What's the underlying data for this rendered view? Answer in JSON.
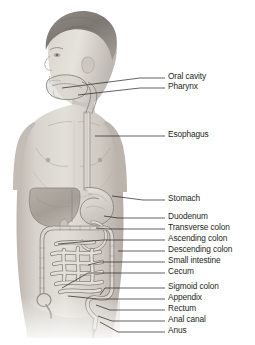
{
  "figure": {
    "view": "anterior male torso, head in left profile",
    "background_color": "#ffffff",
    "line_color": "#231f20",
    "skin_tone": "#cfcac4",
    "organ_tone": "#bdb8b2"
  },
  "labels": [
    {
      "id": "oral-cavity",
      "text": "Oral cavity",
      "text_x": 168,
      "text_y": 78,
      "leader_x1": 140,
      "leader_y1": 78,
      "leader_x2": 165,
      "leader_y2": 78,
      "anchor_x": 62,
      "anchor_y": 88
    },
    {
      "id": "pharynx",
      "text": "Pharynx",
      "text_x": 168,
      "text_y": 88,
      "leader_x1": 140,
      "leader_y1": 88,
      "leader_x2": 165,
      "leader_y2": 88,
      "anchor_x": 78,
      "anchor_y": 95
    },
    {
      "id": "esophagus",
      "text": "Esophagus",
      "text_x": 168,
      "text_y": 136,
      "leader_x1": 112,
      "leader_y1": 136,
      "leader_x2": 165,
      "leader_y2": 136,
      "anchor_x": 95,
      "anchor_y": 136
    },
    {
      "id": "stomach",
      "text": "Stomach",
      "text_x": 168,
      "text_y": 200,
      "leader_x1": 143,
      "leader_y1": 200,
      "leader_x2": 165,
      "leader_y2": 200,
      "anchor_x": 112,
      "anchor_y": 196
    },
    {
      "id": "duodenum",
      "text": "Duodenum",
      "text_x": 168,
      "text_y": 218,
      "leader_x1": 118,
      "leader_y1": 218,
      "leader_x2": 165,
      "leader_y2": 218,
      "anchor_x": 104,
      "anchor_y": 216
    },
    {
      "id": "transverse-colon",
      "text": "Transverse colon",
      "text_x": 168,
      "text_y": 229,
      "leader_x1": 108,
      "leader_y1": 229,
      "leader_x2": 165,
      "leader_y2": 229,
      "anchor_x": 96,
      "anchor_y": 228
    },
    {
      "id": "ascending-colon",
      "text": "Ascending colon",
      "text_x": 168,
      "text_y": 240,
      "leader_x1": 103,
      "leader_y1": 240,
      "leader_x2": 165,
      "leader_y2": 240,
      "anchor_x": 58,
      "anchor_y": 244
    },
    {
      "id": "descending-colon",
      "text": "Descending colon",
      "text_x": 168,
      "text_y": 251,
      "leader_x1": 118,
      "leader_y1": 251,
      "leader_x2": 165,
      "leader_y2": 251,
      "anchor_x": 118,
      "anchor_y": 251
    },
    {
      "id": "small-intestine",
      "text": "Small intestine",
      "text_x": 168,
      "text_y": 262,
      "leader_x1": 100,
      "leader_y1": 262,
      "leader_x2": 165,
      "leader_y2": 262,
      "anchor_x": 88,
      "anchor_y": 265
    },
    {
      "id": "cecum",
      "text": "Cecum",
      "text_x": 168,
      "text_y": 273,
      "leader_x1": 88,
      "leader_y1": 273,
      "leader_x2": 165,
      "leader_y2": 273,
      "anchor_x": 62,
      "anchor_y": 288
    },
    {
      "id": "sigmoid-colon",
      "text": "Sigmoid colon",
      "text_x": 168,
      "text_y": 288,
      "leader_x1": 105,
      "leader_y1": 288,
      "leader_x2": 165,
      "leader_y2": 288,
      "anchor_x": 100,
      "anchor_y": 295
    },
    {
      "id": "appendix",
      "text": "Appendix",
      "text_x": 168,
      "text_y": 299,
      "leader_x1": 98,
      "leader_y1": 299,
      "leader_x2": 165,
      "leader_y2": 299,
      "anchor_x": 68,
      "anchor_y": 296
    },
    {
      "id": "rectum",
      "text": "Rectum",
      "text_x": 168,
      "text_y": 310,
      "leader_x1": 110,
      "leader_y1": 310,
      "leader_x2": 165,
      "leader_y2": 310,
      "anchor_x": 96,
      "anchor_y": 305
    },
    {
      "id": "anal-canal",
      "text": "Anal canal",
      "text_x": 168,
      "text_y": 321,
      "leader_x1": 112,
      "leader_y1": 321,
      "leader_x2": 165,
      "leader_y2": 321,
      "anchor_x": 98,
      "anchor_y": 316
    },
    {
      "id": "anus",
      "text": "Anus",
      "text_x": 168,
      "text_y": 332,
      "leader_x1": 118,
      "leader_y1": 332,
      "leader_x2": 165,
      "leader_y2": 332,
      "anchor_x": 100,
      "anchor_y": 322
    }
  ]
}
